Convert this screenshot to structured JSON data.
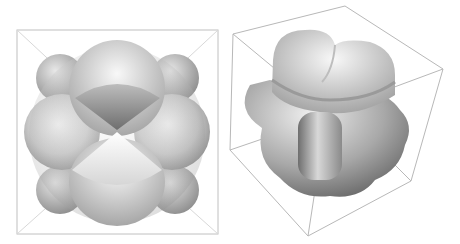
{
  "figure": {
    "panels": [
      {
        "name": "left-panel",
        "description": "Cubic-symmetric lobed surface viewed along axis inside square bounding box"
      },
      {
        "name": "right-panel",
        "description": "Same lobed surface viewed obliquely inside perspective bounding cube"
      }
    ],
    "colors": {
      "background": "#ffffff",
      "box_line": "#b0b0b0",
      "surface_light": "#f2f2f2",
      "surface_dark": "#6a6a6a"
    }
  }
}
